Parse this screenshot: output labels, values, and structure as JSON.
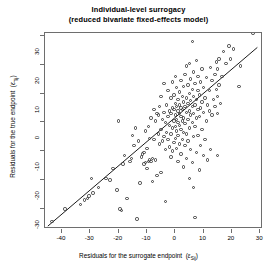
{
  "chart_data": {
    "type": "scatter",
    "title": "Individual-level surrogacy",
    "subtitle": "(reduced bivariate fixed-effects model)",
    "xlabel": "Residuals for the surrogate endpoint",
    "xlabel_symbol": "ε",
    "xlabel_symbol_sub": "Sij",
    "ylabel": "Residuals for the true endpoint",
    "ylabel_symbol": "ε",
    "ylabel_symbol_sub": "Tij",
    "xlim": [
      -46,
      31
    ],
    "ylim": [
      -37,
      31
    ],
    "xticks": [
      -40,
      -30,
      -20,
      -10,
      0,
      10,
      20,
      30
    ],
    "yticks": [
      -30,
      -20,
      -10,
      0,
      10,
      20,
      30
    ],
    "grid": false,
    "legend": null,
    "point_style": "open-circle",
    "point_color": "#3a3a3a",
    "line_color": "#000000",
    "fit_line": {
      "x0": -45.0,
      "y0": -36.0,
      "x1": 29.0,
      "y1": 26.0
    },
    "points": [
      [
        -43.5,
        -34.5
      ],
      [
        -39.0,
        -30.0
      ],
      [
        -33.5,
        -28.5
      ],
      [
        -32.0,
        -27.0
      ],
      [
        -31.0,
        -26.5
      ],
      [
        -30.5,
        -25.5
      ],
      [
        -29.5,
        -19.5
      ],
      [
        -29.0,
        -24.5
      ],
      [
        -27.0,
        -22.5
      ],
      [
        -24.5,
        -19.5
      ],
      [
        -23.0,
        -20.0
      ],
      [
        -22.0,
        -16.0
      ],
      [
        -20.5,
        -23.5
      ],
      [
        -20.0,
        0.5
      ],
      [
        -19.5,
        -30.0
      ],
      [
        -19.0,
        -30.5
      ],
      [
        -18.5,
        -14.5
      ],
      [
        -18.0,
        -11.5
      ],
      [
        -17.0,
        -26.5
      ],
      [
        -16.0,
        -13.5
      ],
      [
        -15.5,
        -12.5
      ],
      [
        -15.0,
        -4.5
      ],
      [
        -14.5,
        -8.0
      ],
      [
        -14.0,
        -2.0
      ],
      [
        -13.5,
        -33.5
      ],
      [
        -13.0,
        -6.5
      ],
      [
        -12.5,
        -21.0
      ],
      [
        -12.0,
        -12.0
      ],
      [
        -11.5,
        -11.0
      ],
      [
        -11.0,
        -10.5
      ],
      [
        -11.0,
        -14.5
      ],
      [
        -10.5,
        -14.0
      ],
      [
        -10.5,
        -3.0
      ],
      [
        -10.0,
        -16.0
      ],
      [
        -10.0,
        -9.0
      ],
      [
        -9.5,
        -13.5
      ],
      [
        -9.5,
        -1.5
      ],
      [
        -9.0,
        -13.0
      ],
      [
        -9.0,
        -5.5
      ],
      [
        -8.5,
        -13.5
      ],
      [
        -8.5,
        1.5
      ],
      [
        -8.0,
        -12.5
      ],
      [
        -8.0,
        -20.5
      ],
      [
        -7.5,
        -6.0
      ],
      [
        -7.5,
        4.5
      ],
      [
        -7.0,
        -13.0
      ],
      [
        -7.0,
        0.5
      ],
      [
        -6.5,
        -18.5
      ],
      [
        -6.5,
        3.0
      ],
      [
        -6.0,
        -4.0
      ],
      [
        -6.0,
        2.5
      ],
      [
        -5.5,
        -7.5
      ],
      [
        -5.5,
        5.5
      ],
      [
        -5.0,
        -17.5
      ],
      [
        -5.0,
        -2.5
      ],
      [
        -5.0,
        9.0
      ],
      [
        -4.5,
        -6.5
      ],
      [
        -4.5,
        1.0
      ],
      [
        -4.0,
        -5.0
      ],
      [
        -4.0,
        3.5
      ],
      [
        -4.0,
        13.5
      ],
      [
        -3.5,
        -27.5
      ],
      [
        -3.5,
        -9.5
      ],
      [
        -3.5,
        0.0
      ],
      [
        -3.0,
        -3.5
      ],
      [
        -3.0,
        6.0
      ],
      [
        -2.5,
        -6.0
      ],
      [
        -2.5,
        2.0
      ],
      [
        -2.5,
        11.0
      ],
      [
        -2.0,
        -8.5
      ],
      [
        -2.0,
        -1.0
      ],
      [
        -2.0,
        4.0
      ],
      [
        -1.5,
        -12.0
      ],
      [
        -1.5,
        -4.0
      ],
      [
        -1.5,
        3.0
      ],
      [
        -1.5,
        8.5
      ],
      [
        -1.0,
        -10.0
      ],
      [
        -1.0,
        -2.0
      ],
      [
        -1.0,
        5.0
      ],
      [
        -1.0,
        14.0
      ],
      [
        -0.5,
        -7.0
      ],
      [
        -0.5,
        0.5
      ],
      [
        -0.5,
        4.5
      ],
      [
        -0.5,
        9.5
      ],
      [
        0.0,
        -5.5
      ],
      [
        0.0,
        -1.5
      ],
      [
        0.0,
        2.5
      ],
      [
        0.0,
        6.5
      ],
      [
        0.0,
        16.0
      ],
      [
        0.5,
        -9.0
      ],
      [
        0.5,
        -3.0
      ],
      [
        0.5,
        1.0
      ],
      [
        0.5,
        5.5
      ],
      [
        0.5,
        12.0
      ],
      [
        1.0,
        -13.5
      ],
      [
        1.0,
        -4.5
      ],
      [
        1.0,
        0.0
      ],
      [
        1.0,
        4.0
      ],
      [
        1.0,
        8.0
      ],
      [
        1.5,
        -7.5
      ],
      [
        1.5,
        -1.0
      ],
      [
        1.5,
        3.0
      ],
      [
        1.5,
        6.0
      ],
      [
        1.5,
        10.5
      ],
      [
        2.0,
        -11.0
      ],
      [
        2.0,
        -2.5
      ],
      [
        2.0,
        2.0
      ],
      [
        2.0,
        5.0
      ],
      [
        2.0,
        14.5
      ],
      [
        2.5,
        -6.0
      ],
      [
        2.5,
        0.5
      ],
      [
        2.5,
        4.5
      ],
      [
        2.5,
        9.0
      ],
      [
        3.0,
        -15.5
      ],
      [
        3.0,
        -3.5
      ],
      [
        3.0,
        1.5
      ],
      [
        3.0,
        7.0
      ],
      [
        3.0,
        12.5
      ],
      [
        3.5,
        -8.0
      ],
      [
        3.5,
        -0.5
      ],
      [
        3.5,
        5.5
      ],
      [
        3.5,
        16.5
      ],
      [
        4.0,
        -12.5
      ],
      [
        4.0,
        -4.0
      ],
      [
        4.0,
        3.5
      ],
      [
        4.0,
        8.5
      ],
      [
        4.0,
        19.5
      ],
      [
        4.5,
        -6.5
      ],
      [
        4.5,
        1.0
      ],
      [
        4.5,
        6.5
      ],
      [
        4.5,
        13.0
      ],
      [
        5.0,
        -19.5
      ],
      [
        5.0,
        -2.0
      ],
      [
        5.0,
        4.0
      ],
      [
        5.0,
        10.0
      ],
      [
        5.0,
        20.5
      ],
      [
        5.5,
        -9.5
      ],
      [
        5.5,
        2.5
      ],
      [
        5.5,
        7.5
      ],
      [
        5.5,
        15.0
      ],
      [
        6.0,
        -14.0
      ],
      [
        6.0,
        0.0
      ],
      [
        6.0,
        5.5
      ],
      [
        6.0,
        11.5
      ],
      [
        6.0,
        28.0
      ],
      [
        6.5,
        -22.5
      ],
      [
        6.5,
        -5.0
      ],
      [
        6.5,
        3.0
      ],
      [
        6.5,
        9.0
      ],
      [
        6.5,
        17.5
      ],
      [
        7.0,
        -33.0
      ],
      [
        7.0,
        -1.5
      ],
      [
        7.0,
        6.0
      ],
      [
        7.0,
        13.5
      ],
      [
        7.5,
        -10.5
      ],
      [
        7.5,
        1.5
      ],
      [
        7.5,
        8.0
      ],
      [
        7.5,
        21.5
      ],
      [
        8.0,
        -4.5
      ],
      [
        8.0,
        4.5
      ],
      [
        8.0,
        11.0
      ],
      [
        8.0,
        16.0
      ],
      [
        8.5,
        -16.5
      ],
      [
        8.5,
        2.0
      ],
      [
        8.5,
        9.5
      ],
      [
        9.0,
        -8.0
      ],
      [
        9.0,
        5.0
      ],
      [
        9.0,
        14.0
      ],
      [
        9.5,
        -2.5
      ],
      [
        9.5,
        7.0
      ],
      [
        9.5,
        18.5
      ],
      [
        10.0,
        -11.5
      ],
      [
        10.0,
        3.5
      ],
      [
        10.0,
        12.0
      ],
      [
        10.5,
        -6.0
      ],
      [
        10.5,
        8.5
      ],
      [
        11.0,
        0.5
      ],
      [
        11.0,
        15.5
      ],
      [
        11.5,
        -13.0
      ],
      [
        11.5,
        6.0
      ],
      [
        12.0,
        4.0
      ],
      [
        12.0,
        11.0
      ],
      [
        12.5,
        -9.5
      ],
      [
        12.5,
        19.0
      ],
      [
        13.0,
        2.5
      ],
      [
        13.0,
        14.5
      ],
      [
        13.5,
        8.0
      ],
      [
        14.0,
        5.5
      ],
      [
        14.0,
        16.5
      ],
      [
        14.5,
        11.5
      ],
      [
        14.5,
        21.0
      ],
      [
        15.0,
        -11.5
      ],
      [
        15.0,
        3.0
      ],
      [
        15.0,
        9.0
      ],
      [
        15.0,
        18.5
      ],
      [
        15.5,
        13.0
      ],
      [
        15.5,
        22.0
      ],
      [
        16.0,
        6.5
      ],
      [
        16.5,
        16.0
      ],
      [
        17.0,
        24.5
      ],
      [
        18.0,
        20.5
      ],
      [
        19.0,
        26.5
      ],
      [
        19.5,
        22.0
      ],
      [
        20.5,
        25.5
      ],
      [
        22.5,
        12.5
      ],
      [
        23.0,
        19.5
      ],
      [
        27.5,
        31.0
      ]
    ]
  }
}
